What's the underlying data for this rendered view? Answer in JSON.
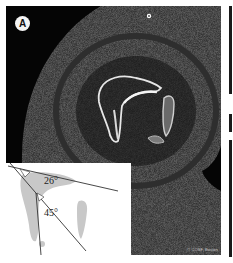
{
  "figure": {
    "panel_label": "A",
    "credit": "© COSF, Boston",
    "marker_icon": "fiducial-dot"
  },
  "inset": {
    "angles": [
      {
        "label": "26°",
        "value": 26
      },
      {
        "label": "45°",
        "value": 45
      }
    ]
  },
  "colors": {
    "background": "#050505",
    "bone": "#e8e8e8",
    "soft_tissue": "#2a2a2a",
    "inset_bg": "#ffffff",
    "inset_shape": "#c8c8c8",
    "inset_lines": "#333333"
  }
}
